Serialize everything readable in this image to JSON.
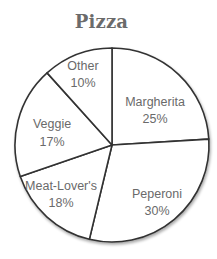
{
  "chart_data": {
    "type": "pie",
    "title": "Pizza",
    "categories": [
      "Margherita",
      "Peperoni",
      "Meat-Lover's",
      "Veggie",
      "Other"
    ],
    "values": [
      25,
      30,
      18,
      17,
      10
    ],
    "value_labels": [
      "25%",
      "30%",
      "18%",
      "17%",
      "10%"
    ],
    "unit": "%",
    "start_angle": "12 o'clock",
    "direction": "clockwise",
    "legend": "none (labels inside slices)",
    "colors": {
      "fill": "#ffffff",
      "stroke": "#333333",
      "label_text": "#6a6a6a",
      "title_text": "#6b6b6b"
    }
  },
  "layout": {
    "center": [
      112,
      145
    ],
    "radius": 97,
    "boundary_angles_deg": [
      0,
      86.5,
      193.5,
      251,
      318
    ],
    "label_positions": [
      {
        "name": [
          155,
          106
        ],
        "value": [
          155,
          123
        ]
      },
      {
        "name": [
          157,
          198
        ],
        "value": [
          157,
          215
        ]
      },
      {
        "name": [
          61,
          190
        ],
        "value": [
          61,
          207
        ]
      },
      {
        "name": [
          52,
          128
        ],
        "value": [
          52,
          146
        ]
      },
      {
        "name": [
          83,
          70
        ],
        "value": [
          83,
          87
        ]
      }
    ]
  }
}
